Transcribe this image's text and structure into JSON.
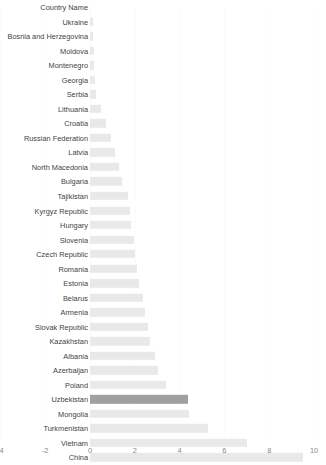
{
  "chart_data": {
    "type": "bar",
    "orientation": "horizontal",
    "title": "",
    "xlabel": "",
    "ylabel": "Country Name",
    "header_label": "Country Name",
    "xlim": [
      -4.02,
      10.54
    ],
    "xticks": [
      -4,
      -2,
      0,
      2,
      4,
      6,
      8,
      10
    ],
    "xticklabels": [
      "-4",
      "-2",
      "0",
      "2",
      "4",
      "6",
      "8",
      "10"
    ],
    "grid": true,
    "legend": "none",
    "bar_color": "#e9e9e9",
    "highlight_color": "#a0a0a0",
    "highlight_category": "Uzbekistan",
    "categories": [
      "Ukraine",
      "Bosnia and Herzegovina",
      "Moldova",
      "Montenegro",
      "Georgia",
      "Serbia",
      "Lithuania",
      "Croatia",
      "Russian Federation",
      "Latvia",
      "North Macedonia",
      "Bulgaria",
      "Tajikistan",
      "Kyrgyz Republic",
      "Hungary",
      "Slovenia",
      "Czech Republic",
      "Romania",
      "Estonia",
      "Belarus",
      "Armenia",
      "Slovak Republic",
      "Kazakhstan",
      "Albania",
      "Azerbaijan",
      "Poland",
      "Uzbekistan",
      "Mongolia",
      "Turkmenistan",
      "Vietnam",
      "China"
    ],
    "values": [
      0.12,
      0.15,
      0.18,
      0.2,
      0.22,
      0.28,
      0.5,
      0.72,
      0.92,
      1.1,
      1.28,
      1.42,
      1.68,
      1.78,
      1.85,
      1.95,
      2.0,
      2.08,
      2.2,
      2.35,
      2.45,
      2.58,
      2.7,
      2.88,
      3.05,
      3.38,
      4.38,
      4.4,
      5.28,
      7.0,
      9.5
    ]
  }
}
